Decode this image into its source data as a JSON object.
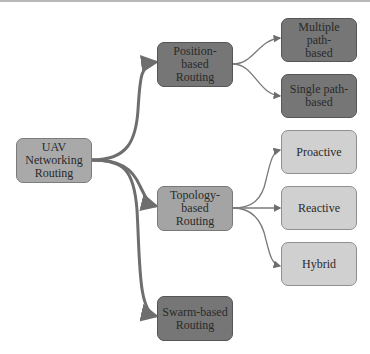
{
  "diagram": {
    "type": "tree",
    "root": {
      "id": "uav",
      "label": "UAV\nNetworking\nRouting"
    },
    "level1": [
      {
        "id": "position",
        "label": "Position-\nbased Routing"
      },
      {
        "id": "topology",
        "label": "Topology-\nbased Routing"
      },
      {
        "id": "swarm",
        "label": "Swarm-based\nRouting"
      }
    ],
    "level2": [
      {
        "id": "multiple",
        "parent": "position",
        "label": "Multiple path-\nbased"
      },
      {
        "id": "single",
        "parent": "position",
        "label": "Single path-\nbased"
      },
      {
        "id": "proactive",
        "parent": "topology",
        "label": "Proactive"
      },
      {
        "id": "reactive",
        "parent": "topology",
        "label": "Reactive"
      },
      {
        "id": "hybrid",
        "parent": "topology",
        "label": "Hybrid"
      }
    ],
    "edges": [
      [
        "uav",
        "position"
      ],
      [
        "uav",
        "topology"
      ],
      [
        "uav",
        "swarm"
      ],
      [
        "position",
        "multiple"
      ],
      [
        "position",
        "single"
      ],
      [
        "topology",
        "proactive"
      ],
      [
        "topology",
        "reactive"
      ],
      [
        "topology",
        "hybrid"
      ]
    ],
    "colors": {
      "root_fill": "#a9a9a9",
      "dark_fill": "#767676",
      "mid_fill": "#a4a4a4",
      "light_fill": "#d0d0d0",
      "edge": "#6e6e6e"
    }
  }
}
